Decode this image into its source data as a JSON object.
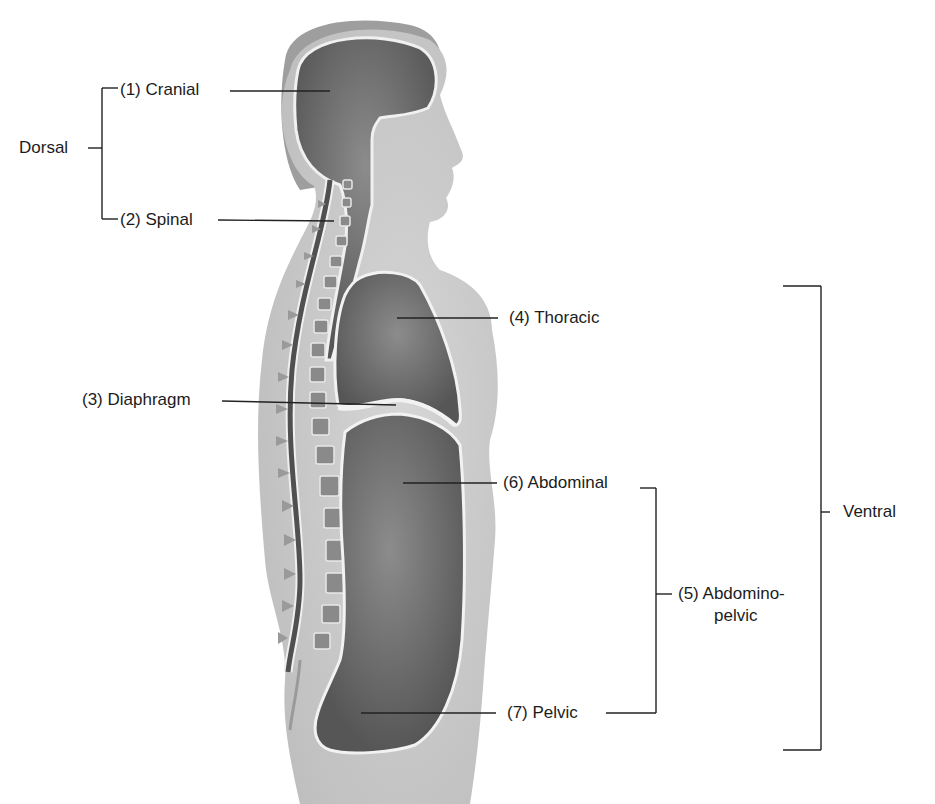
{
  "diagram": {
    "groups": {
      "dorsal": "Dorsal",
      "ventral": "Ventral"
    },
    "labels": {
      "cranial": "(1) Cranial",
      "spinal": "(2) Spinal",
      "diaphragm": "(3) Diaphragm",
      "thoracic": "(4) Thoracic",
      "abdominopelvic_line1": "(5) Abdomino-",
      "abdominopelvic_line2": "pelvic",
      "abdominal": "(6) Abdominal",
      "pelvic": "(7) Pelvic"
    },
    "colors": {
      "background": "#ffffff",
      "body": "#c9c9c9",
      "hair": "#9a9a9a",
      "cavity": "#5a5a5a",
      "cavity_highlight": "#8a8a8a",
      "membrane": "#f2f2f2",
      "leader_line": "#222222"
    }
  }
}
